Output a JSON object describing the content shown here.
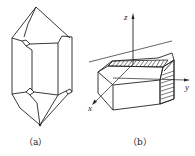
{
  "figures": [
    {
      "id": "a",
      "caption": "（a）",
      "description": "quartz crystal with hexagonal prism and pyramidal terminations"
    },
    {
      "id": "b",
      "caption": "（b）",
      "description": "hexagonal prism block with coordinate axes and hatched faces"
    }
  ],
  "axes": {
    "x": "x",
    "y": "y",
    "z": "z"
  },
  "colors": {
    "line": "#222222",
    "background": "#ffffff"
  }
}
